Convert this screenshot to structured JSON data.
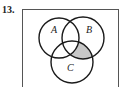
{
  "problem_number": "13.",
  "diagram": {
    "type": "venn-3",
    "sets": [
      {
        "label": "A",
        "cx": 59,
        "cy": 38,
        "r": 20
      },
      {
        "label": "B",
        "cx": 83,
        "cy": 38,
        "r": 21
      },
      {
        "label": "C",
        "cx": 72,
        "cy": 62,
        "r": 21
      }
    ],
    "shaded_region": "B ∩ C − A",
    "shade_color": "#c8c8c8",
    "stroke_color": "#1a1a1a"
  }
}
